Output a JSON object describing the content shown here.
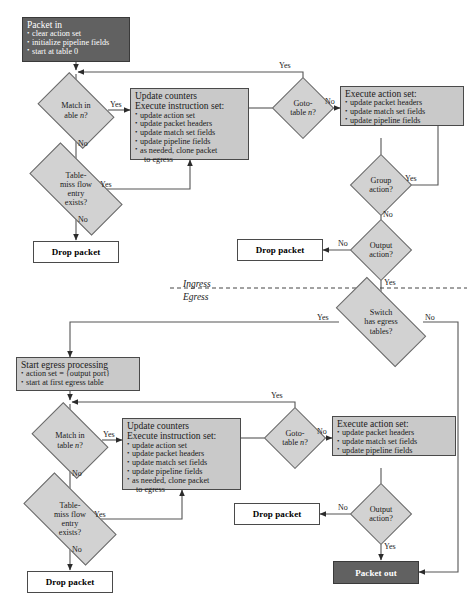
{
  "diagram": {
    "phase_labels": {
      "ingress": "Ingress",
      "egress": "Egress"
    },
    "colors": {
      "terminal_fill": "#616161",
      "terminal_text": "#ffffff",
      "process_fill": "#c9c9c9",
      "decision_fill": "#d2d2d2",
      "plain_fill": "#ffffff",
      "stroke": "#4a4a4a"
    }
  },
  "ingress": {
    "packet_in": {
      "header": "Packet in",
      "items": [
        "clear action set",
        "initialize pipeline fields",
        "start at table 0"
      ]
    },
    "match_decision": {
      "line1": "Match in",
      "line2_pre": "able ",
      "line2_var": "n",
      "line2_post": "?"
    },
    "match_yes": "Yes",
    "match_no": "No",
    "update_counters": {
      "header1": "Update counters",
      "header2": "Execute instruction set:",
      "items": [
        "update action set",
        "update packet headers",
        "update match set fields",
        "update pipeline fields",
        "as needed, clone packet",
        "to egress"
      ]
    },
    "table_miss": {
      "line1": "Table-",
      "line2": "miss flow",
      "line3": "entry",
      "line4": "exists?"
    },
    "table_miss_yes": "Yes",
    "table_miss_no": "No",
    "drop_packet": "Drop packet",
    "goto_table": {
      "line1": "Goto-",
      "line2_pre": "table ",
      "line2_var": "n",
      "line2_post": "?"
    },
    "goto_yes": "Yes",
    "goto_no": "No",
    "execute_action_set": {
      "header": "Execute action set:",
      "items": [
        "update packet headers",
        "update match set fields",
        "update pipeline fields"
      ]
    },
    "group_action": {
      "line1": "Group",
      "line2": "action?"
    },
    "group_yes": "Yes",
    "group_no": "No",
    "output_action": {
      "line1": "Output",
      "line2": "action?"
    },
    "output_no": "No",
    "output_yes": "Yes",
    "output_drop_packet": "Drop packet"
  },
  "egress": {
    "switch_has_egress": {
      "line1": "Switch",
      "line2": "has egress",
      "line3": "tables?"
    },
    "switch_yes": "Yes",
    "switch_no": "No",
    "start_egress": {
      "header": "Start egress processing",
      "items": [
        "action set = {output port}",
        "start at first egress table"
      ]
    },
    "match_decision": {
      "line1": "Match in",
      "line2_pre": "table ",
      "line2_var": "n",
      "line2_post": "?"
    },
    "match_yes": "Yes",
    "match_no": "No",
    "update_counters": {
      "header1": "Update counters",
      "header2": "Execute instruction set:",
      "items": [
        "update action set",
        "update packet headers",
        "update match set fields",
        "update pipeline fields",
        "as needed, clone packet",
        "to egress"
      ]
    },
    "table_miss": {
      "line1": "Table-",
      "line2": "miss flow",
      "line3": "entry",
      "line4": "exists?"
    },
    "table_miss_yes": "Yes",
    "table_miss_no": "No",
    "drop_packet": "Drop packet",
    "goto_table": {
      "line1": "Goto-",
      "line2_pre": "table ",
      "line2_var": "n",
      "line2_post": "?"
    },
    "goto_yes": "Yes",
    "goto_no": "No",
    "execute_action_set": {
      "header": "Execute action set:",
      "items": [
        "update packet headers",
        "update match set fields",
        "update pipeline fields"
      ]
    },
    "output_action": {
      "line1": "Output",
      "line2": "action?"
    },
    "output_no": "No",
    "output_yes": "Yes",
    "output_drop_packet": "Drop packet",
    "packet_out": "Packet out"
  }
}
